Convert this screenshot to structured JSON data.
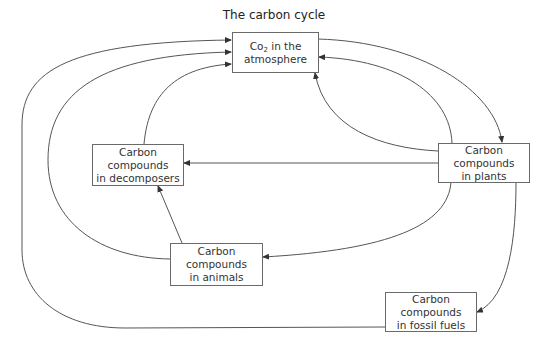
{
  "title": "The carbon cycle",
  "nodes": {
    "atmosphere": {
      "line1_pre": "Co",
      "line1_sub": "2",
      "line1_post": " in the",
      "line2": "atmosphere"
    },
    "decomposers": {
      "line1": "Carbon",
      "line2": "compounds",
      "line3": "in decomposers"
    },
    "plants": {
      "line1": "Carbon",
      "line2": "compounds",
      "line3": "in plants"
    },
    "animals": {
      "line1": "Carbon",
      "line2": "compounds",
      "line3": "in animals"
    },
    "fossil_fuels": {
      "line1": "Carbon",
      "line2": "compounds",
      "line3": "in fossil fuels"
    }
  },
  "edges": [
    {
      "from": "fossil_fuels",
      "to": "atmosphere"
    },
    {
      "from": "animals",
      "to": "atmosphere"
    },
    {
      "from": "decomposers",
      "to": "atmosphere"
    },
    {
      "from": "atmosphere",
      "to": "plants"
    },
    {
      "from": "plants",
      "to": "atmosphere",
      "via": "right"
    },
    {
      "from": "plants",
      "to": "atmosphere",
      "via": "bottom"
    },
    {
      "from": "plants",
      "to": "decomposers"
    },
    {
      "from": "plants",
      "to": "animals"
    },
    {
      "from": "animals",
      "to": "decomposers"
    },
    {
      "from": "plants",
      "to": "fossil_fuels"
    }
  ],
  "colors": {
    "line": "#555555",
    "box_border": "#6a6a6a",
    "text": "#333333"
  }
}
